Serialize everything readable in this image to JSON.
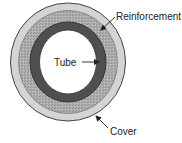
{
  "diagram": {
    "type": "hose-cross-section",
    "layers": [
      {
        "name": "Cover",
        "color": "#d4d4d4"
      },
      {
        "name": "Reinforcement",
        "color": "#a9a9a9"
      },
      {
        "name": "Tube",
        "color": "#4f4f4f"
      }
    ],
    "labels": {
      "reinforcement": "Reinforcement",
      "tube": "Tube",
      "cover": "Cover"
    },
    "colors": {
      "outline": "#444444",
      "cover": "#d4d4d4",
      "reinforcement": "#a9a9a9",
      "tube": "#4f4f4f",
      "bore": "#ffffff",
      "text": "#222222"
    }
  }
}
